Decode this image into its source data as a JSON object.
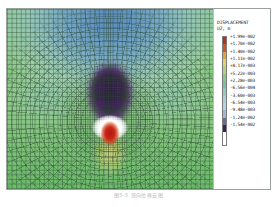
{
  "figure": {
    "caption": "图5-5 竖向位移云图"
  },
  "legend": {
    "title": "DISPLACEMENT",
    "subtitle": "U2, m",
    "labels": [
      "+1.99e-002",
      "+1.70e-002",
      "+1.40e-002",
      "+1.11e-002",
      "+8.17e-003",
      "+5.22e-003",
      "+2.28e-003",
      "-6.56e-004",
      "-3.60e-003",
      "-6.54e-003",
      "-9.48e-003",
      "-1.24e-002",
      "-1.54e-002"
    ],
    "swatch_colors": [
      "#b03024",
      "#c45a2c",
      "#d8a63c",
      "#dcd46c",
      "#b9cf7e",
      "#8ec78a",
      "#7cc0a0",
      "#96c8bc",
      "#a9cfd2",
      "#b6d2de",
      "#9fb6cc",
      "#6d6a92",
      "#3e2456"
    ]
  },
  "chart_data": {
    "type": "heatmap",
    "title": "DISPLACEMENT",
    "subtitle": "U2, m",
    "quantity": "U2",
    "units": "m",
    "colorbar_min": -0.0154,
    "colorbar_max": 0.0199,
    "contour_levels": [
      0.0199,
      0.017,
      0.014,
      0.0111,
      0.00817,
      0.00522,
      0.00228,
      -0.000656,
      -0.0036,
      -0.00654,
      -0.00948,
      -0.0124,
      -0.0154
    ],
    "level_labels": [
      "+1.99e-002",
      "+1.70e-002",
      "+1.40e-002",
      "+1.11e-002",
      "+8.17e-003",
      "+5.22e-003",
      "+2.28e-003",
      "-6.56e-004",
      "-3.60e-003",
      "-6.54e-003",
      "-9.48e-003",
      "-1.24e-002",
      "-1.54e-002"
    ],
    "legend_position": "right",
    "grid": true,
    "xlabel": "",
    "ylabel": ""
  }
}
